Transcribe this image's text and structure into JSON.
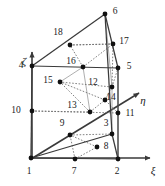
{
  "figure": {
    "name": "18-node-prism-element",
    "width": 165,
    "height": 186,
    "background": "#ffffff",
    "line_color": "#3a3a3a",
    "dashed_color": "#6b6b6b",
    "node_color": "#111111",
    "text_color": "#1a1a1a"
  },
  "axes": [
    {
      "id": "zeta",
      "label": "ζ",
      "label_x": 24,
      "label_y": 61,
      "x1": 32,
      "y1": 158,
      "x2": 32,
      "y2": 52
    },
    {
      "id": "xi",
      "label": "ξ",
      "label_x": 153,
      "label_y": 170,
      "x1": 32,
      "y1": 158,
      "x2": 150,
      "y2": 158
    },
    {
      "id": "eta",
      "label": "η",
      "label_x": 143,
      "label_y": 100,
      "x1": 31,
      "y1": 159,
      "x2": 139,
      "y2": 93
    }
  ],
  "nodes": [
    {
      "id": 1,
      "x": 31,
      "y": 158,
      "label": "1",
      "lx": 29,
      "ly": 172
    },
    {
      "id": 2,
      "x": 118,
      "y": 159,
      "label": "2",
      "lx": 117,
      "ly": 172
    },
    {
      "id": 3,
      "x": 112,
      "y": 134,
      "label": "3",
      "lx": 106,
      "ly": 124
    },
    {
      "id": 4,
      "x": 32,
      "y": 66,
      "label": "4",
      "lx": 21,
      "ly": 66
    },
    {
      "id": 5,
      "x": 118,
      "y": 68,
      "label": "5",
      "lx": 129,
      "ly": 67
    },
    {
      "id": 6,
      "x": 105,
      "y": 14,
      "label": "6",
      "lx": 115,
      "ly": 12
    },
    {
      "id": 7,
      "x": 75,
      "y": 159,
      "label": "7",
      "lx": 74,
      "ly": 172
    },
    {
      "id": 8,
      "x": 97,
      "y": 147,
      "label": "8",
      "lx": 106,
      "ly": 147
    },
    {
      "id": 9,
      "x": 70,
      "y": 135,
      "label": "9",
      "lx": 62,
      "ly": 124
    },
    {
      "id": 10,
      "x": 32,
      "y": 111,
      "label": "10",
      "lx": 16,
      "ly": 111
    },
    {
      "id": 11,
      "x": 118,
      "y": 113,
      "label": "11",
      "lx": 130,
      "ly": 114
    },
    {
      "id": 12,
      "x": 112,
      "y": 87,
      "label": "12",
      "lx": 93,
      "ly": 83
    },
    {
      "id": 13,
      "x": 90,
      "y": 112,
      "label": "13",
      "lx": 72,
      "ly": 106
    },
    {
      "id": 14,
      "x": 105,
      "y": 100,
      "label": "14",
      "lx": 111,
      "ly": 98
    },
    {
      "id": 15,
      "x": 60,
      "y": 82,
      "label": "15",
      "lx": 48,
      "ly": 81
    },
    {
      "id": 16,
      "x": 83,
      "y": 67,
      "label": "16",
      "lx": 71,
      "ly": 62
    },
    {
      "id": 17,
      "x": 113,
      "y": 44,
      "label": "17",
      "lx": 124,
      "ly": 42
    },
    {
      "id": 18,
      "x": 70,
      "y": 45,
      "label": "18",
      "lx": 58,
      "ly": 33
    }
  ],
  "solid_edges": [
    {
      "from": 1,
      "to": 2,
      "name": "edge-1-2"
    },
    {
      "from": 1,
      "to": 3,
      "name": "edge-1-3"
    },
    {
      "from": 2,
      "to": 3,
      "name": "edge-2-3"
    },
    {
      "from": 4,
      "to": 5,
      "name": "edge-4-5"
    },
    {
      "from": 4,
      "to": 6,
      "name": "edge-4-6"
    },
    {
      "from": 5,
      "to": 6,
      "name": "edge-5-6"
    },
    {
      "from": 1,
      "to": 4,
      "name": "edge-1-4"
    },
    {
      "from": 2,
      "to": 5,
      "name": "edge-2-5"
    },
    {
      "from": 3,
      "to": 6,
      "name": "edge-3-6"
    }
  ],
  "dashed_edges": [
    {
      "from": 7,
      "to": 9,
      "name": "edge-7-9"
    },
    {
      "from": 7,
      "to": 8,
      "name": "edge-7-8"
    },
    {
      "from": 8,
      "to": 9,
      "name": "edge-8-9"
    },
    {
      "from": 13,
      "to": 15,
      "name": "edge-13-15"
    },
    {
      "from": 13,
      "to": 14,
      "name": "edge-13-14"
    },
    {
      "from": 14,
      "to": 15,
      "name": "edge-14-15"
    },
    {
      "from": 16,
      "to": 18,
      "name": "edge-16-18"
    },
    {
      "from": 16,
      "to": 17,
      "name": "edge-16-17"
    },
    {
      "from": 17,
      "to": 18,
      "name": "edge-17-18"
    },
    {
      "from": 10,
      "to": 11,
      "name": "edge-10-11"
    },
    {
      "from": 10,
      "to": 13,
      "name": "edge-10-13"
    },
    {
      "from": 11,
      "to": 14,
      "name": "edge-11-14"
    },
    {
      "from": 12,
      "to": 15,
      "name": "edge-12-15"
    },
    {
      "from": 9,
      "to": 3,
      "name": "edge-9-3"
    },
    {
      "from": 12,
      "to": 5,
      "name": "edge-12-5"
    },
    {
      "from": 12,
      "to": 17,
      "name": "edge-12-17"
    },
    {
      "from": 18,
      "to": 17,
      "name": "edge-18-17b"
    }
  ],
  "thin_edges": [
    {
      "from": 10,
      "to": 4,
      "name": "edge-10-4"
    },
    {
      "from": 10,
      "to": 1,
      "name": "edge-10-1"
    },
    {
      "from": 11,
      "to": 5,
      "name": "edge-11-5"
    },
    {
      "from": 11,
      "to": 2,
      "name": "edge-11-2"
    },
    {
      "from": 12,
      "to": 3,
      "name": "edge-12-3"
    },
    {
      "from": 12,
      "to": 6,
      "name": "edge-12-6"
    },
    {
      "from": 14,
      "to": 12,
      "name": "edge-14-12"
    },
    {
      "from": 16,
      "to": 15,
      "name": "edge-16-15"
    },
    {
      "from": 13,
      "to": 16,
      "name": "edge-13-16"
    }
  ]
}
